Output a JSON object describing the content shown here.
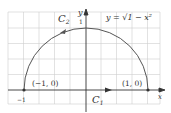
{
  "figure": {
    "curve_label": "C",
    "curve_label_sub": "2",
    "segment_label": "C",
    "segment_label_sub": "1",
    "equation": "y = √1 − x²",
    "y_axis_label": "y",
    "x_axis_label": "x",
    "y_tick": "1",
    "x_tick_left": "−1",
    "point_left": "(−1, 0)",
    "point_right": "(1, 0)",
    "colors": {
      "curve": "#555555",
      "axis": "#333333",
      "grid": "#c8c8c8"
    }
  }
}
